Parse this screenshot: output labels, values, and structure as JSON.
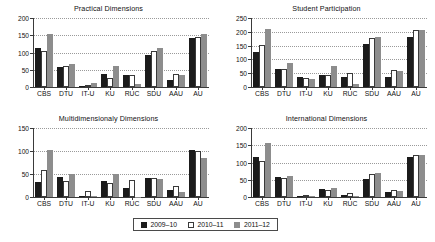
{
  "colors": {
    "series_2009_10": "#1b1b1b",
    "series_2010_11": "#ffffff",
    "series_2011_12": "#8d8d8d",
    "axis": "#3a3a3a",
    "grid": "#9a9a9a",
    "background": "#ffffff"
  },
  "legend": {
    "position": "bottom-center",
    "items": [
      {
        "label": "2009–10",
        "swatch": "black-square-swatch"
      },
      {
        "label": "2010–11",
        "swatch": "white-square-swatch"
      },
      {
        "label": "2011–12",
        "swatch": "gray-square-swatch"
      }
    ]
  },
  "chart_data": [
    {
      "type": "bar",
      "title": "Practical Dimensions",
      "xlabel": "",
      "ylabel": "",
      "ylim": [
        0,
        200
      ],
      "yticks": [
        0,
        50,
        100,
        150,
        200
      ],
      "grid": true,
      "categories": [
        "CBS",
        "DTU",
        "IT-U",
        "KU",
        "RUC",
        "SDU",
        "AAU",
        "AU"
      ],
      "series": [
        {
          "name": "2009–10",
          "values": [
            113,
            57,
            4,
            38,
            35,
            94,
            21,
            142
          ]
        },
        {
          "name": "2010–11",
          "values": [
            104,
            60,
            7,
            27,
            34,
            105,
            39,
            146
          ]
        },
        {
          "name": "2011–12",
          "values": [
            155,
            68,
            12,
            62,
            8,
            112,
            35,
            154
          ]
        }
      ]
    },
    {
      "type": "bar",
      "title": "Student Participation",
      "xlabel": "",
      "ylabel": "",
      "ylim": [
        0,
        250
      ],
      "yticks": [
        0,
        50,
        100,
        150,
        200,
        250
      ],
      "grid": true,
      "categories": [
        "CBS",
        "DTU",
        "IT-U",
        "KU",
        "RUC",
        "SDU",
        "AAU",
        "AU"
      ],
      "series": [
        {
          "name": "2009–10",
          "values": [
            128,
            66,
            35,
            45,
            35,
            155,
            38,
            183
          ]
        },
        {
          "name": "2010–11",
          "values": [
            153,
            65,
            34,
            42,
            49,
            178,
            62,
            206
          ]
        },
        {
          "name": "2011–12",
          "values": [
            212,
            86,
            29,
            75,
            10,
            180,
            57,
            205
          ]
        }
      ]
    },
    {
      "type": "bar",
      "title": "Multidimensionaly Dimensions",
      "xlabel": "",
      "ylabel": "",
      "ylim": [
        0,
        150
      ],
      "yticks": [
        0,
        50,
        100,
        150
      ],
      "grid": true,
      "categories": [
        "CBS",
        "DTU",
        "IT-U",
        "KU",
        "RUC",
        "SDU",
        "AAU",
        "AU"
      ],
      "series": [
        {
          "name": "2009–10",
          "values": [
            33,
            43,
            2,
            35,
            20,
            42,
            16,
            102
          ]
        },
        {
          "name": "2010–11",
          "values": [
            58,
            35,
            13,
            31,
            36,
            42,
            25,
            100
          ]
        },
        {
          "name": "2011–12",
          "values": [
            102,
            51,
            3,
            49,
            0,
            39,
            11,
            85
          ]
        }
      ]
    },
    {
      "type": "bar",
      "title": "International Dimensions",
      "xlabel": "",
      "ylabel": "",
      "ylim": [
        0,
        200
      ],
      "yticks": [
        0,
        50,
        100,
        150,
        200
      ],
      "grid": true,
      "categories": [
        "CBS",
        "DTU",
        "IT-U",
        "KU",
        "RUC",
        "SDU",
        "AAU",
        "AU"
      ],
      "series": [
        {
          "name": "2009–10",
          "values": [
            115,
            58,
            2,
            24,
            5,
            52,
            14,
            117
          ]
        },
        {
          "name": "2010–11",
          "values": [
            104,
            54,
            3,
            21,
            11,
            67,
            21,
            123
          ]
        },
        {
          "name": "2011–12",
          "values": [
            158,
            60,
            3,
            26,
            4,
            71,
            18,
            123
          ]
        }
      ]
    }
  ]
}
